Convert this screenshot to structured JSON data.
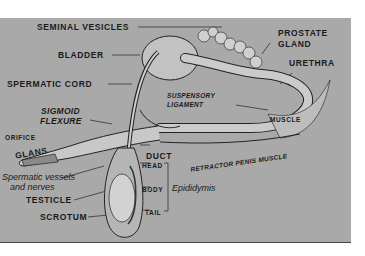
{
  "diagram": {
    "labels": {
      "seminal_vesicles": "SEMINAL VESICLES",
      "prostate_gland_1": "PROSTATE",
      "prostate_gland_2": "GLAND",
      "bladder": "BLADDER",
      "urethra": "URETHRA",
      "spermatic_cord": "SPERMATIC CORD",
      "suspensory_ligament_1": "SUSPENSORY",
      "suspensory_ligament_2": "LIGAMENT",
      "sigmoid_flexure_1": "SIGMOID",
      "sigmoid_flexure_2": "FLEXURE",
      "muscle": "MUSCLE",
      "orifice": "ORIFICE",
      "glans": "GLANS",
      "retractor_penis_muscle": "RETRACTOR PENIS MUSCLE",
      "duct": "DUCT",
      "head": "HEAD",
      "body": "BODY",
      "tail": "TAIL",
      "epididymis": "Epididymis",
      "spermatic_vessels_1": "Spermatic vessels",
      "spermatic_vessels_2": "and nerves",
      "testicle": "TESTICLE",
      "scrotum": "SCROTUM"
    },
    "colors": {
      "background": "#a9a9a9",
      "organ_fill": "#c9c9c9",
      "organ_dark": "#7a7a7a",
      "line": "#222222"
    }
  }
}
